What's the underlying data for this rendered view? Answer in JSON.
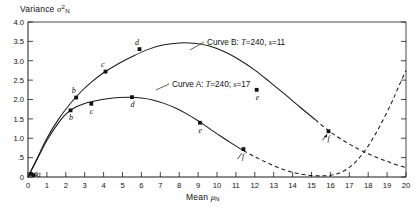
{
  "chart_data": {
    "type": "line",
    "title": "",
    "xlabel": "Mean μₙ",
    "ylabel": "Variance σ²ₙ",
    "xlim": [
      0,
      20
    ],
    "ylim": [
      0,
      4.0
    ],
    "grid": false,
    "legend_position": "inline-annotation",
    "x_ticks": [
      "0",
      "1",
      "2",
      "3",
      "4",
      "5",
      "6",
      "7",
      "8",
      "9",
      "10",
      "11",
      "12",
      "13",
      "14",
      "15",
      "16",
      "17",
      "18",
      "19",
      "20"
    ],
    "y_ticks": [
      "0",
      ".5",
      "1.0",
      "1.5",
      "2.0",
      "2.5",
      "3.0",
      "3.5",
      "4.0"
    ],
    "series": [
      {
        "name": "Curve B",
        "annotation": "Curve B: T=240, s=11",
        "params": {
          "T": "240",
          "s": "11"
        },
        "style": "solid-then-dashed",
        "points": [
          {
            "label": "a",
            "x": 0.15,
            "y": 0.08
          },
          {
            "label": "b",
            "x": 2.55,
            "y": 2.05
          },
          {
            "label": "c",
            "x": 4.1,
            "y": 2.72
          },
          {
            "label": "d",
            "x": 5.9,
            "y": 3.3
          },
          {
            "label": "e",
            "x": 12.1,
            "y": 2.25
          },
          {
            "label": "f",
            "x": 15.9,
            "y": 1.18
          }
        ],
        "path": [
          [
            0,
            0
          ],
          [
            0.5,
            0.5
          ],
          [
            1,
            1.0
          ],
          [
            1.6,
            1.48
          ],
          [
            2.2,
            1.87
          ],
          [
            2.8,
            2.2
          ],
          [
            3.4,
            2.47
          ],
          [
            4.0,
            2.69
          ],
          [
            4.8,
            2.93
          ],
          [
            5.6,
            3.13
          ],
          [
            6.4,
            3.3
          ],
          [
            7.2,
            3.41
          ],
          [
            8.0,
            3.46
          ],
          [
            8.8,
            3.45
          ],
          [
            9.6,
            3.38
          ],
          [
            10.4,
            3.23
          ],
          [
            11.2,
            3.02
          ],
          [
            12.0,
            2.76
          ],
          [
            12.8,
            2.45
          ],
          [
            13.6,
            2.13
          ],
          [
            14.4,
            1.8
          ],
          [
            15.2,
            1.48
          ],
          [
            16.0,
            1.16
          ],
          [
            17.0,
            0.85
          ],
          [
            18.0,
            0.6
          ],
          [
            19.0,
            0.4
          ],
          [
            20.0,
            0.24
          ]
        ],
        "dash_start_x": 15.9
      },
      {
        "name": "Curve A",
        "annotation": "Curve A: T=240; s=17",
        "params": {
          "T": "240",
          "s": "17"
        },
        "style": "solid-then-dashed",
        "points": [
          {
            "label": "a",
            "x": 0.3,
            "y": 0.05
          },
          {
            "label": "b",
            "x": 2.25,
            "y": 1.72
          },
          {
            "label": "c",
            "x": 3.35,
            "y": 1.89
          },
          {
            "label": "d",
            "x": 5.5,
            "y": 2.06
          },
          {
            "label": "e",
            "x": 9.1,
            "y": 1.4
          },
          {
            "label": "f",
            "x": 11.4,
            "y": 0.72
          }
        ],
        "path": [
          [
            0,
            0
          ],
          [
            0.5,
            0.47
          ],
          [
            1.0,
            0.94
          ],
          [
            1.5,
            1.32
          ],
          [
            2.0,
            1.62
          ],
          [
            2.5,
            1.8
          ],
          [
            3.0,
            1.9
          ],
          [
            3.6,
            1.97
          ],
          [
            4.2,
            2.02
          ],
          [
            4.8,
            2.05
          ],
          [
            5.4,
            2.06
          ],
          [
            6.0,
            2.04
          ],
          [
            6.6,
            1.99
          ],
          [
            7.2,
            1.9
          ],
          [
            7.8,
            1.78
          ],
          [
            8.4,
            1.63
          ],
          [
            9.0,
            1.45
          ],
          [
            9.6,
            1.25
          ],
          [
            10.2,
            1.05
          ],
          [
            10.8,
            0.86
          ],
          [
            11.4,
            0.68
          ],
          [
            12.0,
            0.52
          ],
          [
            12.6,
            0.38
          ],
          [
            13.2,
            0.25
          ],
          [
            13.8,
            0.15
          ],
          [
            14.4,
            0.08
          ],
          [
            15.0,
            0.04
          ],
          [
            15.6,
            0.03
          ],
          [
            16.2,
            0.06
          ],
          [
            16.8,
            0.18
          ],
          [
            17.4,
            0.42
          ],
          [
            18.0,
            0.8
          ],
          [
            18.6,
            1.3
          ],
          [
            19.2,
            1.88
          ],
          [
            19.6,
            2.32
          ],
          [
            20.0,
            2.75
          ]
        ],
        "dash_start_x": 11.4
      }
    ]
  }
}
